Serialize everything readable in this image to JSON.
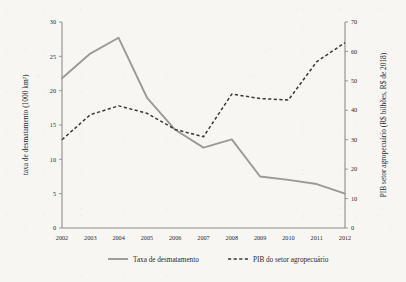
{
  "chart_data": {
    "type": "line",
    "title": "",
    "xlabel": "",
    "categories": [
      "2002",
      "2003",
      "2004",
      "2005",
      "2006",
      "2007",
      "2008",
      "2009",
      "2010",
      "2011",
      "2012"
    ],
    "x": [
      2002,
      2003,
      2004,
      2005,
      2006,
      2007,
      2008,
      2009,
      2010,
      2011,
      2012
    ],
    "grid": false,
    "legend_position": "bottom",
    "axes": {
      "left": {
        "label": "taxa de desmatamento (1000 km²)",
        "ylim": [
          0,
          30
        ],
        "ticks": [
          0,
          5,
          10,
          15,
          20,
          25,
          30
        ],
        "tick_labels": [
          "0",
          "5",
          "10",
          "15",
          "20",
          "25",
          "30"
        ]
      },
      "right": {
        "label": "PIB setor agropecuário (R$ bilhões, R$ de 2018)",
        "ylim": [
          0,
          70
        ],
        "ticks": [
          0,
          10,
          20,
          30,
          40,
          50,
          60,
          70
        ],
        "tick_labels": [
          "0",
          "10",
          "20",
          "30",
          "40",
          "50",
          "60",
          "70"
        ]
      }
    },
    "series": [
      {
        "name": "Taxa de desmatamento",
        "axis": "left",
        "style": "solid",
        "color": "#9a9a9a",
        "values": [
          21.8,
          25.4,
          27.7,
          19.0,
          14.3,
          11.7,
          12.9,
          7.5,
          7.0,
          6.4,
          5.0
        ]
      },
      {
        "name": "PIB do setor agropecuário",
        "axis": "right",
        "style": "dashed",
        "color": "#3a3a3a",
        "values": [
          30.0,
          38.5,
          41.5,
          39.0,
          33.5,
          31.0,
          45.5,
          44.0,
          43.5,
          56.5,
          63.0
        ]
      }
    ],
    "legend": [
      {
        "label": "Taxa de desmatamento",
        "style": "solid",
        "color": "#9a9a9a"
      },
      {
        "label": "PIB do setor agropecuário",
        "style": "dashed",
        "color": "#3a3a3a"
      }
    ]
  }
}
